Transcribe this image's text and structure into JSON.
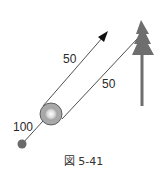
{
  "diagram": {
    "labels": {
      "arrow_distance": "50",
      "tree_distance": "50",
      "dot_distance": "100"
    },
    "caption": "図 5-41",
    "colors": {
      "tree": "#6e6e6e",
      "ball_outer": "#a9a9a9",
      "ball_inner_highlight": "#f4f4f4",
      "dot": "#6a6a6a",
      "line": "#222222"
    },
    "elements": [
      {
        "name": "tree",
        "icon": "tree-icon"
      },
      {
        "name": "ball",
        "icon": "ball-icon"
      },
      {
        "name": "small-dot",
        "icon": "dot-icon"
      },
      {
        "name": "arrow-line",
        "icon": "arrow-icon"
      },
      {
        "name": "tree-line"
      }
    ]
  }
}
